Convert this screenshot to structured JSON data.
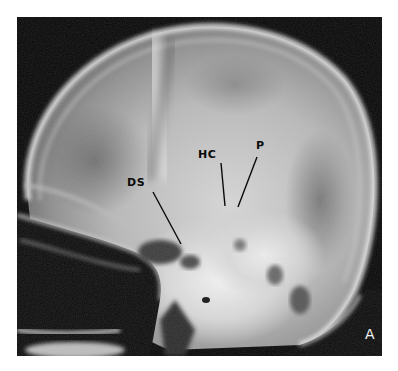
{
  "figure": {
    "panel_letter": "A",
    "annotations": [
      {
        "id": "ds",
        "text": "DS",
        "label_x": 127,
        "label_y": 178,
        "line": [
          153,
          192,
          181,
          244
        ]
      },
      {
        "id": "hc",
        "text": "HC",
        "label_x": 198,
        "label_y": 150,
        "line": [
          221,
          163,
          225,
          206
        ]
      },
      {
        "id": "p",
        "text": "P",
        "label_x": 255,
        "label_y": 141,
        "line": [
          257,
          157,
          238,
          207
        ]
      }
    ],
    "colors": {
      "background": "#ffffff",
      "film": "#050505",
      "bone": "#e8e8e8",
      "label_text": "#0a0a0a",
      "panel_letter": "#f2f2f2"
    }
  }
}
